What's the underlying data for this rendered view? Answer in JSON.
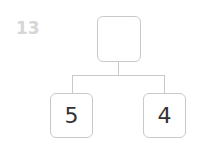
{
  "problem": {
    "number": "13"
  },
  "tree": {
    "root": {
      "value": ""
    },
    "children": [
      {
        "value": "5"
      },
      {
        "value": "4"
      }
    ]
  }
}
